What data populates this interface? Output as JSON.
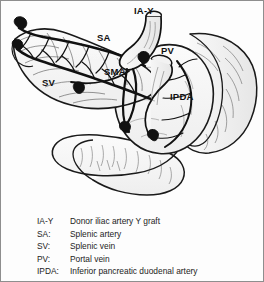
{
  "figure": {
    "type": "anatomical-line-drawing",
    "background_color": "#fdfdfd",
    "border_color": "#8e8e8e",
    "ink_color": "#111111"
  },
  "annotations": [
    {
      "id": "iay",
      "label": "IA-Y",
      "x": 133,
      "y": 5
    },
    {
      "id": "sa",
      "label": "SA",
      "x": 96,
      "y": 32
    },
    {
      "id": "sma",
      "label": "SMA",
      "x": 103,
      "y": 66
    },
    {
      "id": "sv",
      "label": "SV",
      "x": 41,
      "y": 77
    },
    {
      "id": "pv",
      "label": "PV",
      "x": 160,
      "y": 45
    },
    {
      "id": "ipda",
      "label": "IPDA",
      "x": 169,
      "y": 91
    }
  ],
  "legend": {
    "rows": [
      {
        "abbr": "IA-Y",
        "desc": "Donor iliac artery Y graft"
      },
      {
        "abbr": "SA:",
        "desc": "Splenic artery"
      },
      {
        "abbr": "SV:",
        "desc": "Splenic vein"
      },
      {
        "abbr": "PV:",
        "desc": "Portal vein"
      },
      {
        "abbr": "IPDA:",
        "desc": "Inferior pancreatic duodenal artery"
      }
    ]
  }
}
